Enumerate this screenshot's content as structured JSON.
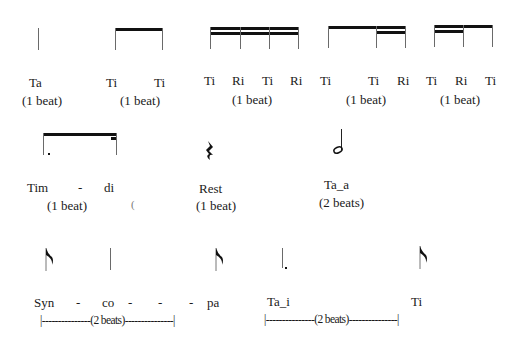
{
  "row1": {
    "ta": {
      "syllables": [
        "Ta"
      ],
      "duration": "(1 beat)"
    },
    "ti_ti": {
      "syllables": [
        "Ti",
        "Ti"
      ],
      "duration": "(1 beat)"
    },
    "ti_ri_ti_ri": {
      "syllables": [
        "Ti",
        "Ri",
        "Ti",
        "Ri"
      ],
      "duration": "(1 beat)"
    },
    "ti_ti_ri": {
      "syllables": [
        "Ti",
        "Ti",
        "Ri"
      ],
      "duration": "(1 beat)"
    },
    "ti_ri_ti": {
      "syllables": [
        "Ti",
        "Ri",
        "Ti"
      ],
      "duration": "(1 beat)"
    }
  },
  "row2": {
    "tim_di": {
      "syllables": [
        "Tim",
        "-",
        "di"
      ],
      "duration": "(1 beat)",
      "stray": "("
    },
    "rest": {
      "label": "Rest",
      "duration": "(1 beat)"
    },
    "ta_a": {
      "label": "Ta_a",
      "duration": "(2 beats)"
    }
  },
  "row3": {
    "syncopa": {
      "syllables": [
        "Syn",
        "-",
        "co",
        "-",
        "-",
        "-",
        "pa"
      ],
      "duration": "|---------------(2 beats)---------------|"
    },
    "ta_i_ti": {
      "syllables": [
        "Ta_i",
        "Ti"
      ],
      "duration": "|---------------(2 beats)---------------|"
    }
  }
}
